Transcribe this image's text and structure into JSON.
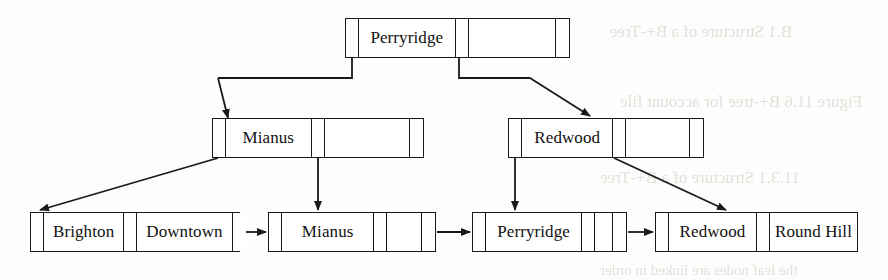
{
  "figure": {
    "type": "b-plus-tree",
    "levels": 3
  },
  "nodes": {
    "root": {
      "name": "root-node",
      "x": 345,
      "y": 18,
      "width": 225,
      "cells": [
        {
          "kind": "pointer",
          "label": "",
          "width": 13
        },
        {
          "kind": "key",
          "label": "Perryridge",
          "width": 97
        },
        {
          "kind": "pointer",
          "label": "",
          "width": 13
        },
        {
          "kind": "blank",
          "label": "",
          "width": 88
        },
        {
          "kind": "pointer",
          "label": "",
          "width": 14
        }
      ]
    },
    "internal_left": {
      "name": "internal-node-mianus",
      "x": 212,
      "y": 118,
      "width": 212,
      "cells": [
        {
          "kind": "pointer",
          "label": "",
          "width": 13
        },
        {
          "kind": "key",
          "label": "Mianus",
          "width": 86
        },
        {
          "kind": "pointer",
          "label": "",
          "width": 13
        },
        {
          "kind": "blank",
          "label": "",
          "width": 86
        },
        {
          "kind": "pointer",
          "label": "",
          "width": 14
        }
      ]
    },
    "internal_right": {
      "name": "internal-node-redwood",
      "x": 508,
      "y": 118,
      "width": 196,
      "cells": [
        {
          "kind": "pointer",
          "label": "",
          "width": 13
        },
        {
          "kind": "key",
          "label": "Redwood",
          "width": 92
        },
        {
          "kind": "pointer",
          "label": "",
          "width": 13
        },
        {
          "kind": "blank",
          "label": "",
          "width": 64
        },
        {
          "kind": "pointer",
          "label": "",
          "width": 14
        }
      ]
    },
    "leaf_1": {
      "name": "leaf-node-brighton-downtown",
      "x": 30,
      "y": 212,
      "width": 210,
      "cells": [
        {
          "kind": "pointer",
          "label": "",
          "width": 13
        },
        {
          "kind": "key",
          "label": "Brighton",
          "width": 85
        },
        {
          "kind": "pointer",
          "label": "",
          "width": 13
        },
        {
          "kind": "key",
          "label": "Downtown",
          "width": 100
        },
        {
          "kind": "pointer",
          "label": "",
          "width": 13
        }
      ]
    },
    "leaf_2": {
      "name": "leaf-node-mianus",
      "x": 268,
      "y": 212,
      "width": 168,
      "cells": [
        {
          "kind": "pointer",
          "label": "",
          "width": 13
        },
        {
          "kind": "key",
          "label": "Mianus",
          "width": 93
        },
        {
          "kind": "pointer",
          "label": "",
          "width": 13
        },
        {
          "kind": "blank",
          "label": "",
          "width": 35
        },
        {
          "kind": "pointer",
          "label": "",
          "width": 13
        }
      ]
    },
    "leaf_3": {
      "name": "leaf-node-perryridge",
      "x": 472,
      "y": 212,
      "width": 155,
      "cells": [
        {
          "kind": "pointer",
          "label": "",
          "width": 13
        },
        {
          "kind": "key",
          "label": "Perryridge",
          "width": 97
        },
        {
          "kind": "pointer",
          "label": "",
          "width": 13
        },
        {
          "kind": "blank",
          "label": "",
          "width": 18
        },
        {
          "kind": "pointer",
          "label": "",
          "width": 13
        }
      ]
    },
    "leaf_4": {
      "name": "leaf-node-redwood-roundhill",
      "x": 655,
      "y": 212,
      "width": 203,
      "cells": [
        {
          "kind": "pointer",
          "label": "",
          "width": 13
        },
        {
          "kind": "key",
          "label": "Redwood",
          "width": 89
        },
        {
          "kind": "pointer",
          "label": "",
          "width": 13
        },
        {
          "kind": "key",
          "label": "Round Hill",
          "width": 87
        },
        {
          "kind": "pointer",
          "label": "",
          "width": 0
        }
      ]
    }
  },
  "keys": {
    "root_key": "Perryridge",
    "internal_left_key": "Mianus",
    "internal_right_key": "Redwood",
    "leaf_keys": [
      "Brighton",
      "Downtown",
      "Mianus",
      "Perryridge",
      "Redwood",
      "Round Hill"
    ]
  },
  "edges": [
    {
      "name": "edge-root-to-mianus",
      "from": "root",
      "to": "internal_left"
    },
    {
      "name": "edge-root-to-redwood",
      "from": "root",
      "to": "internal_right"
    },
    {
      "name": "edge-mianus-to-leaf1",
      "from": "internal_left",
      "to": "leaf_1"
    },
    {
      "name": "edge-mianus-to-leaf2",
      "from": "internal_left",
      "to": "leaf_2"
    },
    {
      "name": "edge-redwood-to-leaf3",
      "from": "internal_right",
      "to": "leaf_3"
    },
    {
      "name": "edge-redwood-to-leaf4",
      "from": "internal_right",
      "to": "leaf_4"
    },
    {
      "name": "edge-leaf1-to-leaf2",
      "from": "leaf_1",
      "to": "leaf_2"
    },
    {
      "name": "edge-leaf2-to-leaf3",
      "from": "leaf_2",
      "to": "leaf_3"
    },
    {
      "name": "edge-leaf3-to-leaf4",
      "from": "leaf_3",
      "to": "leaf_4"
    }
  ],
  "artifacts": {
    "note": "faint mirrored bleed-through text from the reverse side of the scanned page",
    "lines": [
      {
        "name": "bleed-text-top",
        "text": "B.1  Structure of a B+-Tree",
        "x": 610,
        "y": 22,
        "size": 17
      },
      {
        "name": "bleed-text-mid",
        "text": "Figure 11.6   B+-tree for account file",
        "x": 620,
        "y": 92,
        "size": 17
      },
      {
        "name": "bleed-text-lower",
        "text": "11.3.1  Structure of a B+-Tree",
        "x": 600,
        "y": 168,
        "size": 17
      },
      {
        "name": "bleed-text-bottom",
        "text": "the leaf nodes are linked in order",
        "x": 600,
        "y": 262,
        "size": 15
      }
    ]
  },
  "colors": {
    "ink": "#1a1a1a",
    "paper": "#fdfdfb",
    "bleed": "#c9c9c4"
  }
}
